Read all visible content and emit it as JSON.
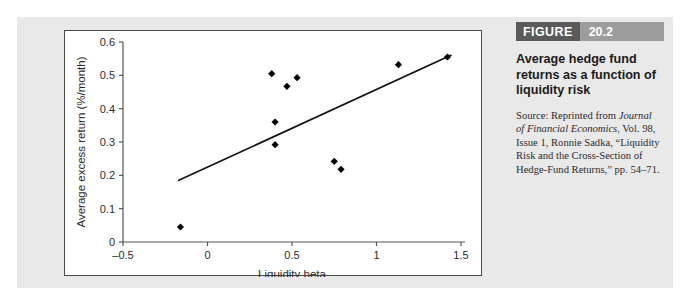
{
  "figure": {
    "label": "FIGURE",
    "number": "20.2",
    "title": "Average hedge fund returns as a function of liquidity risk",
    "source_lines": [
      "Source: Reprinted from",
      "Journal of Financial",
      "Economics, Vol. 98, Issue 1,",
      "Ronnie Sadka, “Liquidity",
      "Risk and the Cross-Section",
      "of Hedge-Fund Returns,”",
      "pp. 54–71."
    ],
    "source_prefix": "Source: Reprinted from",
    "source_journal": "Journal of Financial Economics",
    "source_rest": ", Vol. 98, Issue 1, Ronnie Sadka, “Liquidity Risk and the Cross-Section of Hedge-Fund Returns,” pp. 54–71."
  },
  "colors": {
    "figure_label_bg": "#5a5a5a",
    "figure_number_bg": "#9d9d9d",
    "panel_bg": "#e9e9e9",
    "card_bg": "#ffffff",
    "marker": "#000000",
    "axis": "#555555",
    "trendline": "#111111"
  },
  "chart_data": {
    "type": "scatter",
    "title": "",
    "xlabel": "Liquidity beta",
    "ylabel": "Average excess return (%/month)",
    "xlim": [
      -0.5,
      1.5
    ],
    "ylim": [
      0,
      0.6
    ],
    "xticks": [
      -0.5,
      0,
      0.5,
      1,
      1.5
    ],
    "xtick_labels": [
      "–0.5",
      "0",
      "0.5",
      "1",
      "1.5"
    ],
    "yticks": [
      0,
      0.1,
      0.2,
      0.3,
      0.4,
      0.5,
      0.6
    ],
    "ytick_labels": [
      "0",
      "0.1",
      "0.2",
      "0.3",
      "0.4",
      "0.5",
      "0.6"
    ],
    "grid": false,
    "legend": false,
    "marker_shape": "diamond",
    "points": [
      {
        "x": -0.16,
        "y": 0.045
      },
      {
        "x": 0.38,
        "y": 0.505
      },
      {
        "x": 0.4,
        "y": 0.36
      },
      {
        "x": 0.4,
        "y": 0.292
      },
      {
        "x": 0.47,
        "y": 0.467
      },
      {
        "x": 0.53,
        "y": 0.493
      },
      {
        "x": 0.75,
        "y": 0.242
      },
      {
        "x": 0.79,
        "y": 0.218
      },
      {
        "x": 1.13,
        "y": 0.532
      },
      {
        "x": 1.42,
        "y": 0.555
      }
    ],
    "trendline": {
      "x_start": -0.17,
      "y_start": 0.185,
      "x_end": 1.44,
      "y_end": 0.56
    }
  }
}
